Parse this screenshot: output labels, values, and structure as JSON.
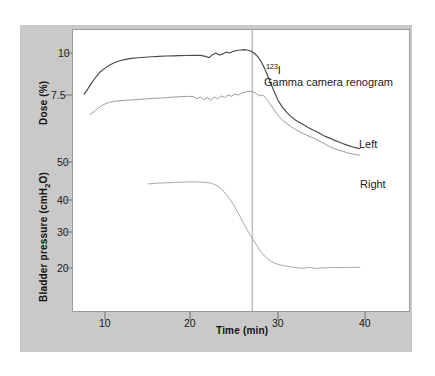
{
  "chart_data": {
    "type": "line",
    "title": "",
    "xlabel": "Time (min)",
    "ylabel_top": "Dose (%)",
    "ylabel_bottom": "Bladder pressure (cmH2O)",
    "ylabel_bottom_display": "Bladder pressure (cmH",
    "ylabel_bottom_sub": "2",
    "ylabel_bottom_tail": "O)",
    "xlim": [
      6.5,
      43.5
    ],
    "xticks": [
      10,
      20,
      30,
      40
    ],
    "xtick_labels": [
      "10",
      "20",
      "30",
      "40"
    ],
    "dose_ticks": [
      10,
      7.5
    ],
    "dose_tick_labels": [
      "10",
      "7.5"
    ],
    "pressure_ticks": [
      50,
      40,
      30,
      20
    ],
    "pressure_tick_labels": [
      "50",
      "40",
      "30",
      "20"
    ],
    "grid": false,
    "legend": "inline-annotations",
    "annotations": [
      {
        "name": "isotope",
        "text_sup": "123",
        "text": "I"
      },
      {
        "name": "study-type",
        "text": "Gamma camera renogram"
      },
      {
        "name": "curve-label-left",
        "text": "Left"
      },
      {
        "name": "curve-label-right",
        "text": "Right"
      }
    ],
    "marker_line": {
      "x": 27.0,
      "label": "",
      "color": "#c0c0c0"
    },
    "series": [
      {
        "name": "Left",
        "axis": "dose",
        "color": "#4a4a4a",
        "x": [
          7.6,
          8.0,
          8.5,
          9.0,
          9.5,
          10.0,
          10.6,
          11.2,
          11.8,
          12.4,
          13.0,
          13.8,
          14.6,
          15.4,
          16.2,
          17.0,
          17.8,
          18.6,
          19.4,
          20.2,
          21.0,
          21.6,
          22.0,
          22.4,
          22.8,
          23.2,
          23.6,
          24.0,
          24.4,
          24.8,
          25.2,
          25.6,
          26.0,
          26.4,
          26.8,
          27.2,
          27.6,
          28.0,
          28.4,
          28.8,
          29.2,
          29.6,
          30.0,
          30.5,
          31.0,
          31.5,
          32.0,
          32.5,
          33.0,
          33.5,
          34.0,
          34.5,
          35.0,
          35.5,
          36.0,
          36.5,
          37.0,
          37.5,
          38.0,
          38.5,
          39.0,
          39.4
        ],
        "y": [
          7.55,
          7.85,
          8.25,
          8.6,
          8.9,
          9.1,
          9.3,
          9.45,
          9.55,
          9.62,
          9.68,
          9.72,
          9.75,
          9.78,
          9.8,
          9.82,
          9.83,
          9.84,
          9.85,
          9.86,
          9.86,
          9.8,
          9.72,
          9.9,
          10.0,
          9.88,
          9.95,
          10.05,
          10.0,
          10.1,
          10.15,
          10.18,
          10.2,
          10.18,
          10.12,
          10.0,
          9.8,
          9.5,
          9.1,
          8.6,
          8.1,
          7.6,
          7.15,
          6.75,
          6.45,
          6.2,
          6.0,
          5.85,
          5.7,
          5.55,
          5.42,
          5.3,
          5.15,
          5.02,
          4.92,
          4.8,
          4.7,
          4.6,
          4.5,
          4.42,
          4.35,
          4.3
        ]
      },
      {
        "name": "Right",
        "axis": "dose",
        "color": "#9b9b9b",
        "x": [
          8.3,
          8.8,
          9.3,
          9.8,
          10.4,
          11.0,
          11.6,
          12.2,
          12.8,
          13.4,
          14.0,
          14.8,
          15.6,
          16.4,
          17.2,
          18.0,
          18.8,
          19.6,
          20.2,
          20.6,
          21.0,
          21.4,
          21.8,
          22.2,
          22.6,
          23.0,
          23.4,
          23.8,
          24.2,
          24.6,
          25.0,
          25.4,
          25.8,
          26.2,
          26.6,
          27.0,
          27.4,
          27.8,
          28.2,
          28.6,
          29.0,
          29.4,
          29.8,
          30.2,
          30.6,
          31.0,
          31.5,
          32.0,
          32.5,
          33.0,
          33.5,
          34.0,
          34.5,
          35.0,
          35.5,
          36.0,
          36.5,
          37.0,
          37.5,
          38.0,
          38.5,
          39.0,
          39.4
        ],
        "y": [
          6.35,
          6.55,
          6.75,
          6.92,
          7.05,
          7.12,
          7.15,
          7.18,
          7.2,
          7.22,
          7.24,
          7.27,
          7.3,
          7.32,
          7.35,
          7.38,
          7.4,
          7.42,
          7.4,
          7.28,
          7.38,
          7.22,
          7.35,
          7.2,
          7.38,
          7.28,
          7.45,
          7.35,
          7.5,
          7.42,
          7.55,
          7.5,
          7.62,
          7.68,
          7.72,
          7.7,
          7.6,
          7.45,
          7.5,
          7.3,
          7.0,
          6.7,
          6.4,
          6.15,
          5.95,
          5.8,
          5.6,
          5.45,
          5.3,
          5.18,
          5.05,
          4.95,
          4.82,
          4.68,
          4.55,
          4.4,
          4.3,
          4.2,
          4.15,
          4.05,
          4.0,
          3.95,
          3.92
        ]
      },
      {
        "name": "Bladder pressure",
        "axis": "pressure",
        "color": "#a8a8a8",
        "x": [
          15.0,
          16.0,
          17.0,
          18.0,
          19.0,
          20.0,
          21.0,
          21.8,
          22.4,
          23.0,
          23.5,
          24.0,
          24.4,
          24.8,
          25.2,
          25.6,
          26.0,
          26.4,
          26.8,
          27.2,
          27.6,
          28.0,
          28.4,
          28.8,
          29.2,
          29.6,
          30.0,
          30.5,
          31.0,
          31.5,
          32.0,
          32.5,
          33.0,
          33.5,
          34.0,
          34.5,
          35.0,
          35.5,
          36.0,
          36.5,
          37.0,
          37.5,
          38.0,
          38.5,
          39.0,
          39.4
        ],
        "y": [
          43.8,
          44.0,
          44.1,
          44.2,
          44.3,
          44.4,
          44.3,
          44.2,
          43.9,
          43.2,
          42.2,
          40.8,
          39.5,
          38.0,
          36.3,
          34.5,
          32.6,
          30.8,
          29.2,
          27.6,
          26.0,
          24.6,
          23.4,
          22.5,
          21.8,
          21.3,
          21.0,
          20.7,
          20.5,
          20.3,
          20.1,
          20.0,
          19.9,
          20.2,
          20.0,
          19.85,
          20.1,
          20.0,
          20.2,
          20.1,
          20.15,
          20.1,
          20.2,
          20.15,
          20.2,
          20.2
        ]
      }
    ]
  },
  "colors": {
    "panel_bg": "#c9c9c9",
    "plot_bg": "#ffffff",
    "frame": "#9a9a9a",
    "left_curve": "#4a4a4a",
    "right_curve": "#9b9b9b",
    "pressure_curve": "#a8a8a8",
    "marker": "#c0c0c0",
    "text": "#1a1a1a"
  }
}
